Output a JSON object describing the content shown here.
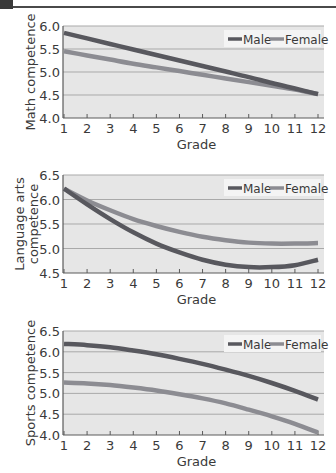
{
  "colors": {
    "male": "#58585e",
    "female": "#8c8c92",
    "plot_bg": "#e6e6e6",
    "grid": "#a9a9a9",
    "axis": "#5a5a5a",
    "legend_bg": "#f4f4f4"
  },
  "chart_data": [
    {
      "type": "line",
      "title": "",
      "xlabel": "Grade",
      "ylabel": "Math competence",
      "x": [
        1,
        2,
        3,
        4,
        5,
        6,
        7,
        8,
        9,
        10,
        11,
        12
      ],
      "x_ticks": [
        "1",
        "2",
        "3",
        "4",
        "5",
        "6",
        "7",
        "8",
        "9",
        "10",
        "11",
        "12"
      ],
      "y_ticks": [
        "4.0",
        "4.5",
        "5.0",
        "5.5",
        "6.0"
      ],
      "ylim": [
        4.0,
        6.0
      ],
      "grid": true,
      "legend_position": "top-right",
      "series": [
        {
          "name": "Male",
          "values": [
            5.85,
            5.73,
            5.61,
            5.49,
            5.37,
            5.25,
            5.13,
            5.01,
            4.89,
            4.76,
            4.64,
            4.52
          ]
        },
        {
          "name": "Female",
          "values": [
            5.45,
            5.36,
            5.27,
            5.18,
            5.1,
            5.02,
            4.94,
            4.86,
            4.78,
            4.7,
            4.62,
            4.52
          ]
        }
      ]
    },
    {
      "type": "line",
      "title": "",
      "xlabel": "Grade",
      "ylabel": "Language arts competence",
      "x": [
        1,
        2,
        3,
        4,
        5,
        6,
        7,
        8,
        9,
        10,
        11,
        12
      ],
      "x_ticks": [
        "1",
        "2",
        "3",
        "4",
        "5",
        "6",
        "7",
        "8",
        "9",
        "10",
        "11",
        "12"
      ],
      "y_ticks": [
        "4.5",
        "5.0",
        "5.5",
        "6.0",
        "6.5"
      ],
      "ylim": [
        4.5,
        6.5
      ],
      "grid": true,
      "legend_position": "top-right",
      "series": [
        {
          "name": "Male",
          "values": [
            6.22,
            5.9,
            5.6,
            5.33,
            5.1,
            4.92,
            4.77,
            4.67,
            4.62,
            4.62,
            4.66,
            4.77
          ]
        },
        {
          "name": "Female",
          "values": [
            6.22,
            5.98,
            5.78,
            5.6,
            5.46,
            5.34,
            5.24,
            5.17,
            5.12,
            5.1,
            5.1,
            5.11
          ]
        }
      ]
    },
    {
      "type": "line",
      "title": "",
      "xlabel": "Grade",
      "ylabel": "Sports competence",
      "x": [
        1,
        2,
        3,
        4,
        5,
        6,
        7,
        8,
        9,
        10,
        11,
        12
      ],
      "x_ticks": [
        "1",
        "2",
        "3",
        "4",
        "5",
        "6",
        "7",
        "8",
        "9",
        "10",
        "11",
        "12"
      ],
      "y_ticks": [
        "4.0",
        "4.5",
        "5.0",
        "5.5",
        "6.0",
        "6.5"
      ],
      "ylim": [
        4.0,
        6.5
      ],
      "grid": true,
      "legend_position": "top-right",
      "series": [
        {
          "name": "Male",
          "values": [
            6.19,
            6.16,
            6.11,
            6.03,
            5.94,
            5.83,
            5.71,
            5.57,
            5.42,
            5.25,
            5.06,
            4.85
          ]
        },
        {
          "name": "Female",
          "values": [
            5.26,
            5.24,
            5.2,
            5.14,
            5.07,
            4.98,
            4.88,
            4.76,
            4.61,
            4.45,
            4.27,
            4.06
          ]
        }
      ]
    }
  ]
}
